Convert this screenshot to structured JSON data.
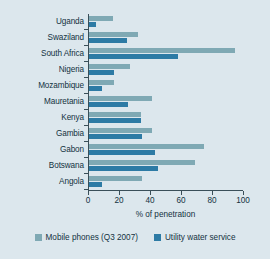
{
  "chart_data": {
    "type": "bar",
    "orientation": "horizontal",
    "title": "",
    "xlabel": "% of penetration",
    "ylabel": "",
    "xlim": [
      0,
      100
    ],
    "xticks": [
      0,
      20,
      40,
      60,
      80,
      100
    ],
    "grid": false,
    "legend_position": "bottom",
    "categories": [
      "Uganda",
      "Swaziland",
      "South Africa",
      "Nigeria",
      "Mozambique",
      "Mauretania",
      "Kenya",
      "Gambia",
      "Gabon",
      "Botswana",
      "Angola"
    ],
    "series": [
      {
        "name": "Mobile phones (Q3 2007)",
        "color": "#7fa9b4",
        "values": [
          16,
          32,
          95,
          27,
          17,
          41,
          34,
          41,
          75,
          69,
          35
        ]
      },
      {
        "name": "Utility water service",
        "color": "#2d7ba5",
        "values": [
          5,
          25,
          58,
          17,
          9,
          26,
          34,
          35,
          43,
          45,
          9
        ]
      }
    ]
  },
  "colors": {
    "background": "#dce7ed",
    "axis": "#3a4f59",
    "text": "#13323f",
    "series_light": "#7fa9b4",
    "series_dark": "#2d7ba5"
  }
}
